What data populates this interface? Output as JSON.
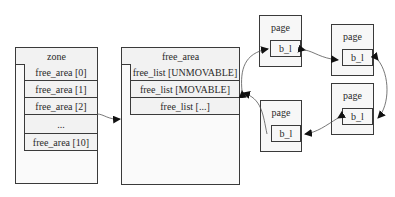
{
  "zone": {
    "title": "zone",
    "rows": [
      "free_area [0]",
      "free_area [1]",
      "free_area [2]",
      "...",
      "free_area [10]"
    ]
  },
  "free_area": {
    "title": "free_area",
    "rows": [
      "free_list [UNMOVABLE]",
      "free_list [MOVABLE]",
      "free_list [...]"
    ]
  },
  "pages": [
    {
      "label": "page",
      "field": "b_l"
    },
    {
      "label": "page",
      "field": "b_l"
    },
    {
      "label": "page",
      "field": "b_l"
    },
    {
      "label": "page",
      "field": "b_l"
    }
  ]
}
